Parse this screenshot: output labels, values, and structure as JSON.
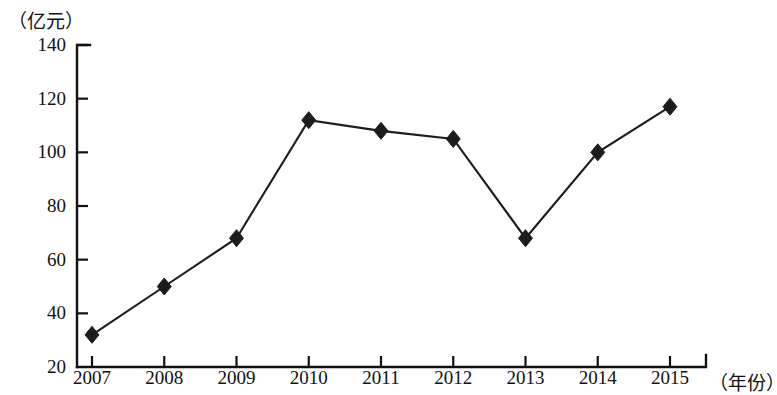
{
  "chart_data": {
    "type": "line",
    "title": "",
    "subtitle": "",
    "xlabel": "（年份）",
    "ylabel": "（亿元）",
    "categories": [
      "2007",
      "2008",
      "2009",
      "2010",
      "2011",
      "2012",
      "2013",
      "2014",
      "2015"
    ],
    "values": [
      32,
      50,
      68,
      112,
      108,
      105,
      68,
      100,
      117
    ],
    "series": [
      {
        "name": "",
        "values": [
          32,
          50,
          68,
          112,
          108,
          105,
          68,
          100,
          117
        ]
      }
    ],
    "ylim": [
      20,
      140
    ],
    "yticks": [
      20,
      40,
      60,
      80,
      100,
      120,
      140
    ],
    "ytick_labels": [
      "20",
      "40",
      "60",
      "80",
      "100",
      "120",
      "140"
    ],
    "xticks": [
      "2007",
      "2008",
      "2009",
      "2010",
      "2011",
      "2012",
      "2013",
      "2014",
      "2015"
    ],
    "grid": false,
    "legend": false,
    "legend_position": "none",
    "marker": "diamond",
    "line_color": "#1c1c1c",
    "marker_color": "#1c1c1c",
    "axis_color": "#111111",
    "background_color": "#ffffff",
    "annotations": []
  }
}
